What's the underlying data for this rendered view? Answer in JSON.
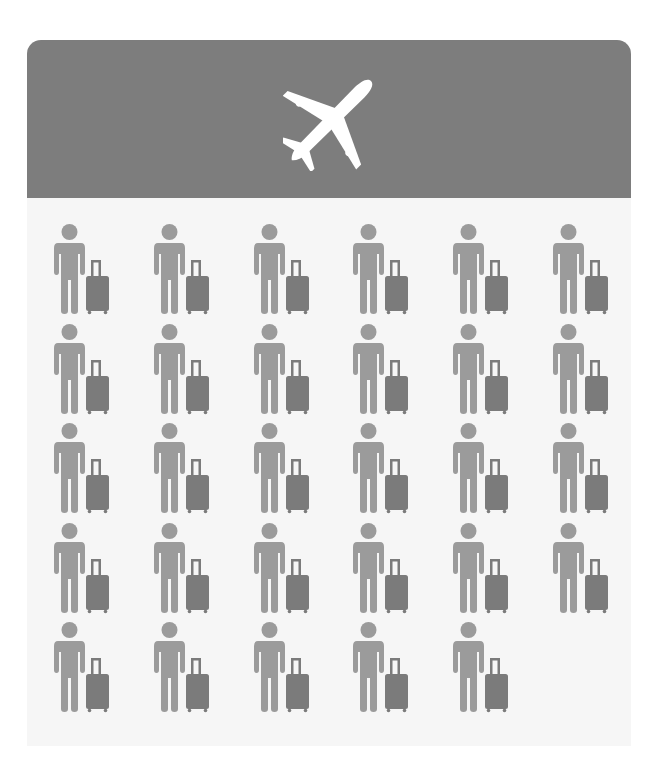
{
  "infographic": {
    "header": {
      "icon": "airplane-icon",
      "background_color": "#7d7d7d",
      "icon_color": "#ffffff"
    },
    "body": {
      "background_color": "#f6f6f6",
      "traveler_icon": "person-with-suitcase-icon",
      "person_color": "#9b9b9b",
      "suitcase_color": "#7b7b7b",
      "rows": 5,
      "columns": 6,
      "total_travelers": 29,
      "row_counts": [
        6,
        6,
        6,
        6,
        5
      ]
    }
  }
}
